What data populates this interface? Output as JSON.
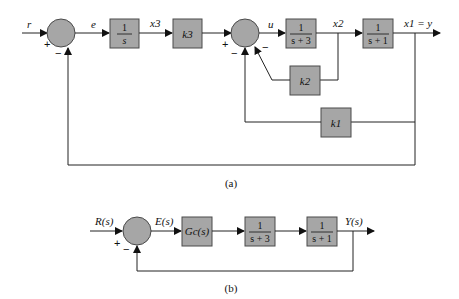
{
  "diagram_a": {
    "caption": "(a)",
    "signals": {
      "r": "r",
      "e": "e",
      "x3": "x3",
      "u": "u",
      "x2": "x2",
      "x1_eq_y": "x1 = y"
    },
    "blocks": {
      "integrator_num": "1",
      "integrator_den": "s",
      "k3": "k3",
      "plant1_num": "1",
      "plant1_den": "s + 3",
      "plant2_num": "1",
      "plant2_den": "s + 1",
      "k2": "k2",
      "k1": "k1"
    },
    "signs": {
      "sum1_plus": "+",
      "sum1_minus": "−",
      "sum2_plus": "+",
      "sum2_minus_k1": "−",
      "sum2_minus_k2": "−"
    }
  },
  "diagram_b": {
    "caption": "(b)",
    "signals": {
      "R": "R(s)",
      "E": "E(s)",
      "Y": "Y(s)"
    },
    "blocks": {
      "controller": "Gc(s)",
      "plant1_num": "1",
      "plant1_den": "s + 3",
      "plant2_num": "1",
      "plant2_den": "s + 1"
    },
    "signs": {
      "plus": "+",
      "minus": "−"
    }
  },
  "colors": {
    "block_fill": "#a6a6a6",
    "line": "#222222"
  }
}
